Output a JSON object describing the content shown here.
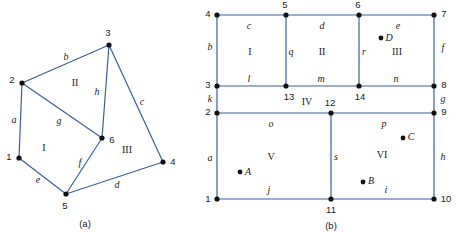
{
  "figure": {
    "caption_a": "(a)",
    "caption_b": "(b)",
    "colors": {
      "edge": "#3a5f9e",
      "node": "#111111",
      "text": "#1a1a1a",
      "background": "#ffffff"
    }
  },
  "panel_a": {
    "name": "graph-a",
    "caption": "(a)",
    "nodes": [
      {
        "id": "1",
        "label": "1",
        "x": 19,
        "y": 158,
        "label_x": 9,
        "label_y": 157
      },
      {
        "id": "2",
        "label": "2",
        "x": 22,
        "y": 83,
        "label_x": 12,
        "label_y": 80
      },
      {
        "id": "3",
        "label": "3",
        "x": 109,
        "y": 45,
        "label_x": 108,
        "label_y": 33
      },
      {
        "id": "4",
        "label": "4",
        "x": 163,
        "y": 162,
        "label_x": 173,
        "label_y": 162
      },
      {
        "id": "5",
        "label": "5",
        "x": 66,
        "y": 194,
        "label_x": 65,
        "label_y": 206
      },
      {
        "id": "6",
        "label": "6",
        "x": 102,
        "y": 138,
        "label_x": 112,
        "label_y": 140
      }
    ],
    "edges": [
      {
        "label": "a",
        "from": "1",
        "to": "2",
        "label_x": 14,
        "label_y": 120
      },
      {
        "label": "b",
        "from": "2",
        "to": "3",
        "label_x": 66,
        "label_y": 57
      },
      {
        "label": "c",
        "from": "3",
        "to": "4",
        "label_x": 142,
        "label_y": 102
      },
      {
        "label": "d",
        "from": "5",
        "to": "4",
        "label_x": 117,
        "label_y": 185
      },
      {
        "label": "e",
        "from": "1",
        "to": "5",
        "label_x": 38,
        "label_y": 180
      },
      {
        "label": "f",
        "from": "5",
        "to": "6",
        "label_x": 80,
        "label_y": 163
      },
      {
        "label": "g",
        "from": "2",
        "to": "6",
        "label_x": 59,
        "label_y": 121
      },
      {
        "label": "h",
        "from": "3",
        "to": "6",
        "label_x": 97,
        "label_y": 92
      }
    ],
    "faces": [
      {
        "label": "I",
        "x": 44,
        "y": 148
      },
      {
        "label": "II",
        "x": 75,
        "y": 83
      },
      {
        "label": "III",
        "x": 127,
        "y": 150
      }
    ],
    "caption_x": 85,
    "caption_y": 224
  },
  "panel_b": {
    "name": "graph-b",
    "caption": "(b)",
    "nodes": [
      {
        "id": "1",
        "label": "1",
        "x": 217,
        "y": 199,
        "label_x": 208,
        "label_y": 199
      },
      {
        "id": "2",
        "label": "2",
        "x": 217,
        "y": 113,
        "label_x": 208,
        "label_y": 112
      },
      {
        "id": "3",
        "label": "3",
        "x": 217,
        "y": 86,
        "label_x": 208,
        "label_y": 85
      },
      {
        "id": "4",
        "label": "4",
        "x": 217,
        "y": 15,
        "label_x": 208,
        "label_y": 14
      },
      {
        "id": "5",
        "label": "5",
        "x": 286,
        "y": 15,
        "label_x": 285,
        "label_y": 5
      },
      {
        "id": "6",
        "label": "6",
        "x": 359,
        "y": 15,
        "label_x": 358,
        "label_y": 5
      },
      {
        "id": "7",
        "label": "7",
        "x": 434,
        "y": 15,
        "label_x": 444,
        "label_y": 14
      },
      {
        "id": "8",
        "label": "8",
        "x": 434,
        "y": 86,
        "label_x": 444,
        "label_y": 85
      },
      {
        "id": "9",
        "label": "9",
        "x": 434,
        "y": 113,
        "label_x": 444,
        "label_y": 112
      },
      {
        "id": "10",
        "label": "10",
        "x": 434,
        "y": 199,
        "label_x": 446,
        "label_y": 199
      },
      {
        "id": "11",
        "label": "11",
        "x": 331,
        "y": 199,
        "label_x": 331,
        "label_y": 210
      },
      {
        "id": "12",
        "label": "12",
        "x": 331,
        "y": 113,
        "label_x": 330,
        "label_y": 103
      },
      {
        "id": "13",
        "label": "13",
        "x": 286,
        "y": 86,
        "label_x": 289,
        "label_y": 97
      },
      {
        "id": "14",
        "label": "14",
        "x": 359,
        "y": 86,
        "label_x": 360,
        "label_y": 97
      }
    ],
    "edges": [
      {
        "label": "a",
        "from": "1",
        "to": "2",
        "label_x": 210,
        "label_y": 158
      },
      {
        "label": "b",
        "from": "3",
        "to": "4",
        "label_x": 210,
        "label_y": 47
      },
      {
        "label": "c",
        "from": "4",
        "to": "5",
        "label_x": 249,
        "label_y": 26
      },
      {
        "label": "d",
        "from": "5",
        "to": "6",
        "label_x": 322,
        "label_y": 26
      },
      {
        "label": "e",
        "from": "6",
        "to": "7",
        "label_x": 398,
        "label_y": 26
      },
      {
        "label": "f",
        "from": "7",
        "to": "8",
        "label_x": 443,
        "label_y": 48
      },
      {
        "label": "g",
        "from": "8",
        "to": "9",
        "label_x": 443,
        "label_y": 99
      },
      {
        "label": "h",
        "from": "9",
        "to": "10",
        "label_x": 443,
        "label_y": 157
      },
      {
        "label": "i",
        "from": "11",
        "to": "10",
        "label_x": 386,
        "label_y": 190
      },
      {
        "label": "j",
        "from": "1",
        "to": "11",
        "label_x": 269,
        "label_y": 190
      },
      {
        "label": "k",
        "from": "2",
        "to": "3",
        "label_x": 210,
        "label_y": 99
      },
      {
        "label": "l",
        "from": "3",
        "to": "13",
        "label_x": 249,
        "label_y": 79
      },
      {
        "label": "m",
        "from": "13",
        "to": "14",
        "label_x": 321,
        "label_y": 79
      },
      {
        "label": "n",
        "from": "14",
        "to": "8",
        "label_x": 396,
        "label_y": 79
      },
      {
        "label": "o",
        "from": "2",
        "to": "12",
        "label_x": 271,
        "label_y": 124
      },
      {
        "label": "p",
        "from": "12",
        "to": "9",
        "label_x": 384,
        "label_y": 124
      },
      {
        "label": "q",
        "from": "5",
        "to": "13",
        "label_x": 291,
        "label_y": 52
      },
      {
        "label": "r",
        "from": "6",
        "to": "14",
        "label_x": 364,
        "label_y": 52
      },
      {
        "label": "s",
        "from": "12",
        "to": "11",
        "label_x": 336,
        "label_y": 157
      }
    ],
    "faces": [
      {
        "label": "I",
        "x": 250,
        "y": 52
      },
      {
        "label": "II",
        "x": 322,
        "y": 52
      },
      {
        "label": "III",
        "x": 397,
        "y": 52
      },
      {
        "label": "IV",
        "x": 307,
        "y": 102
      },
      {
        "label": "V",
        "x": 271,
        "y": 157
      },
      {
        "label": "VI",
        "x": 382,
        "y": 155
      }
    ],
    "points": [
      {
        "label": "A",
        "x": 240,
        "y": 172,
        "label_x": 248,
        "label_y": 172
      },
      {
        "label": "B",
        "x": 363,
        "y": 182,
        "label_x": 371,
        "label_y": 181
      },
      {
        "label": "C",
        "x": 403,
        "y": 138,
        "label_x": 411,
        "label_y": 137
      },
      {
        "label": "D",
        "x": 381,
        "y": 38,
        "label_x": 389,
        "label_y": 38
      }
    ],
    "caption_x": 331,
    "caption_y": 226
  }
}
